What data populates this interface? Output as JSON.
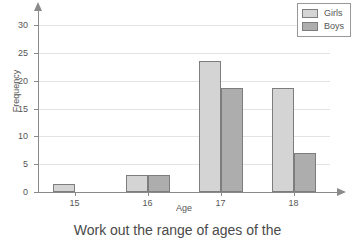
{
  "chart_data": {
    "type": "bar",
    "title": "",
    "xlabel": "Age",
    "ylabel": "Frequency",
    "categories": [
      "15",
      "16",
      "17",
      "18"
    ],
    "series": [
      {
        "name": "Girls",
        "color": "#d4d4d4",
        "values": [
          1.5,
          3,
          23.5,
          18.7
        ]
      },
      {
        "name": "Boys",
        "color": "#adadad",
        "values": [
          0,
          3,
          18.7,
          7.1
        ]
      }
    ],
    "ylim": [
      0,
      32
    ],
    "yticks": [
      "0",
      "5",
      "10",
      "15",
      "20",
      "25",
      "30"
    ],
    "ytick_values": [
      0,
      5,
      10,
      15,
      20,
      25,
      30
    ],
    "grid": true,
    "legend_position": "top-right"
  },
  "legend": {
    "entries": [
      {
        "label": "Girls"
      },
      {
        "label": "Boys"
      }
    ]
  },
  "caption": {
    "text": "Work out the range of ages of the"
  }
}
